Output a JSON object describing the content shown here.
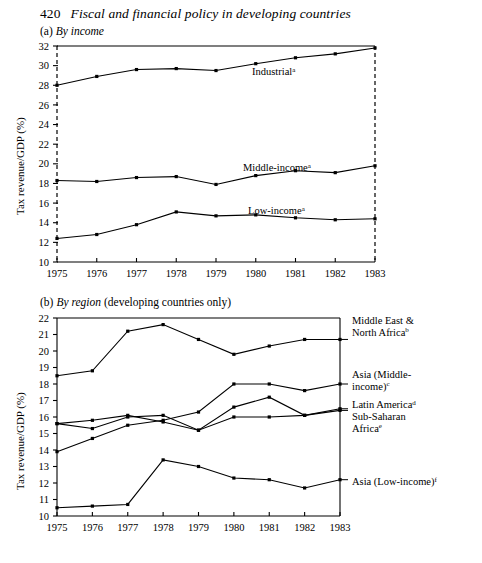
{
  "header": {
    "page_number": "420",
    "title": "Fiscal and financial policy in developing countries"
  },
  "panel_a": {
    "caption_label": "(a)",
    "caption_emphasis": "By income",
    "caption_rest": "",
    "ylabel": "Tax revenue/GDP (%)"
  },
  "panel_b": {
    "caption_label": "(b)",
    "caption_emphasis": "By region",
    "caption_rest": "(developing countries only)",
    "ylabel": "Tax revenue/GDP (%)"
  },
  "chart_data": [
    {
      "type": "line",
      "id": "panel-a",
      "title": "(a) By income",
      "xlabel": "",
      "ylabel": "Tax revenue/GDP (%)",
      "x": [
        1975,
        1976,
        1977,
        1978,
        1979,
        1980,
        1981,
        1982,
        1983
      ],
      "xtick_labels": [
        "1975",
        "1976",
        "1977",
        "1978",
        "1979",
        "1980",
        "1981",
        "1982",
        "1983"
      ],
      "ytick_labels": [
        "10",
        "12",
        "14",
        "16",
        "18",
        "20",
        "22",
        "24",
        "26",
        "28",
        "30",
        "32"
      ],
      "ylim": [
        10,
        32
      ],
      "xlim": [
        1975,
        1983
      ],
      "grid": false,
      "legend": "inline-right-of-series",
      "series": [
        {
          "name": "Industrial",
          "footnote": "a",
          "label": "Industrial",
          "values": [
            28.0,
            28.9,
            29.6,
            29.7,
            29.5,
            30.2,
            30.8,
            31.2,
            31.8
          ]
        },
        {
          "name": "Middle-income",
          "footnote": "a",
          "label": "Middle-income",
          "values": [
            18.3,
            18.2,
            18.6,
            18.7,
            17.9,
            18.8,
            19.3,
            19.1,
            19.8
          ]
        },
        {
          "name": "Low-income",
          "footnote": "a",
          "label": "Low-income",
          "values": [
            12.4,
            12.8,
            13.8,
            15.1,
            14.7,
            14.8,
            14.5,
            14.3,
            14.4
          ]
        }
      ]
    },
    {
      "type": "line",
      "id": "panel-b",
      "title": "(b) By region (developing countries only)",
      "xlabel": "",
      "ylabel": "Tax revenue/GDP (%)",
      "x": [
        1975,
        1976,
        1977,
        1978,
        1979,
        1980,
        1981,
        1982,
        1983
      ],
      "xtick_labels": [
        "1975",
        "1976",
        "1977",
        "1978",
        "1979",
        "1980",
        "1981",
        "1982",
        "1983"
      ],
      "ytick_labels": [
        "10",
        "11",
        "12",
        "13",
        "14",
        "15",
        "16",
        "17",
        "18",
        "19",
        "20",
        "21",
        "22"
      ],
      "ylim": [
        10,
        22
      ],
      "xlim": [
        1975,
        1983
      ],
      "grid": false,
      "legend": "right-of-plot",
      "series": [
        {
          "name": "Middle East & North Africa",
          "footnote": "b",
          "label_line1": "Middle East &",
          "label_line2": "North Africa",
          "values": [
            18.5,
            18.8,
            21.2,
            21.6,
            20.7,
            19.8,
            20.3,
            20.7,
            20.7
          ]
        },
        {
          "name": "Asia (Middle-income)",
          "footnote": "c",
          "label_line1": "Asia (Middle-",
          "label_line2": "income)",
          "values": [
            13.9,
            14.7,
            15.5,
            15.8,
            16.3,
            18.0,
            18.0,
            17.6,
            18.0
          ]
        },
        {
          "name": "Latin America",
          "footnote": "d",
          "label_line1": "Latin America",
          "label_line2": "",
          "values": [
            15.6,
            15.8,
            16.1,
            15.7,
            15.2,
            16.6,
            17.2,
            16.1,
            16.5
          ]
        },
        {
          "name": "Sub-Saharan Africa",
          "footnote": "e",
          "label_line1": "Sub-Saharan",
          "label_line2": "Africa",
          "values": [
            15.6,
            15.3,
            16.0,
            16.1,
            15.2,
            16.0,
            16.0,
            16.1,
            16.4
          ]
        },
        {
          "name": "Asia (Low-income)",
          "footnote": "f",
          "label_line1": "Asia (Low-income)",
          "label_line2": "",
          "values": [
            10.5,
            10.6,
            10.7,
            13.4,
            13.0,
            12.3,
            12.2,
            11.7,
            12.2
          ]
        }
      ]
    }
  ]
}
